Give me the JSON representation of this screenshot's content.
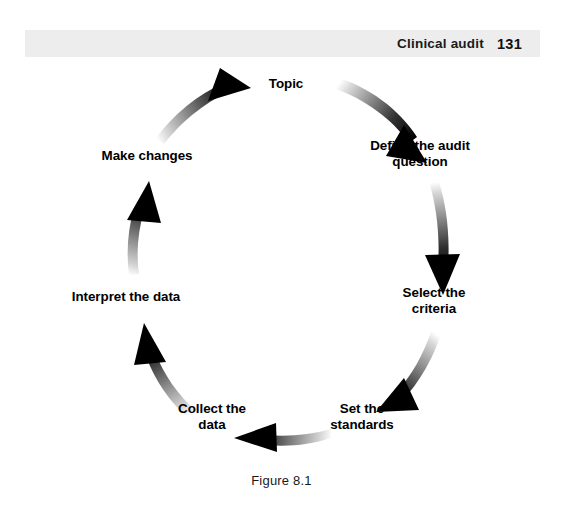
{
  "header": {
    "title": "Clinical audit",
    "page_number": "131",
    "band_color": "#ededed"
  },
  "figure": {
    "caption": "Figure 8.1",
    "text_color": "#000000",
    "background_color": "#ffffff",
    "arrow_color": "#000000"
  },
  "cycle": {
    "direction": "clockwise",
    "center": {
      "x": 281,
      "y": 213
    },
    "radius": 155,
    "nodes": [
      {
        "id": "topic",
        "label": "Topic",
        "angle_deg": -90,
        "x": 286,
        "y": 27,
        "lines": 1
      },
      {
        "id": "define-question",
        "label": "Define the audit\nquestion",
        "angle_deg": -38,
        "x": 420,
        "y": 97,
        "lines": 2
      },
      {
        "id": "select-criteria",
        "label": "Select the\ncriteria",
        "angle_deg": 25,
        "x": 434,
        "y": 244,
        "lines": 2
      },
      {
        "id": "set-standards",
        "label": "Set the\nstandards",
        "angle_deg": 70,
        "x": 362,
        "y": 360,
        "lines": 2
      },
      {
        "id": "collect-data",
        "label": "Collect the\ndata",
        "angle_deg": 110,
        "x": 212,
        "y": 360,
        "lines": 2
      },
      {
        "id": "interpret-data",
        "label": "Interpret the data",
        "angle_deg": 160,
        "x": 126,
        "y": 240,
        "lines": 1
      },
      {
        "id": "make-changes",
        "label": "Make changes",
        "angle_deg": -150,
        "x": 147,
        "y": 99,
        "lines": 1
      }
    ],
    "arrows": [
      {
        "id": "arrow-topic-to-define",
        "from": "topic",
        "to": "define-question"
      },
      {
        "id": "arrow-define-to-select",
        "from": "define-question",
        "to": "select-criteria"
      },
      {
        "id": "arrow-select-to-standards",
        "from": "select-criteria",
        "to": "set-standards"
      },
      {
        "id": "arrow-standards-to-collect",
        "from": "set-standards",
        "to": "collect-data"
      },
      {
        "id": "arrow-collect-to-interpret",
        "from": "collect-data",
        "to": "interpret-data"
      },
      {
        "id": "arrow-interpret-to-changes",
        "from": "interpret-data",
        "to": "make-changes"
      },
      {
        "id": "arrow-changes-to-topic",
        "from": "make-changes",
        "to": "topic"
      }
    ]
  }
}
